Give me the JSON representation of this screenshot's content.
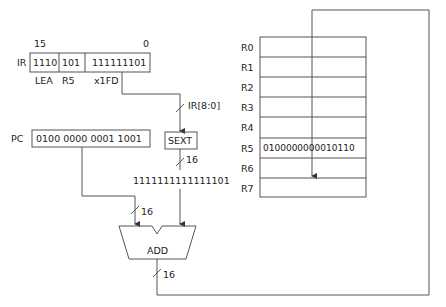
{
  "ir": {
    "label": "IR",
    "bit_high": "15",
    "bit_low": "0",
    "fields": [
      "1110",
      "101",
      "111111101"
    ],
    "field_labels": [
      "LEA",
      "R5",
      "x1FD"
    ]
  },
  "pc": {
    "label": "PC",
    "value": "0100 0000 0001 1001"
  },
  "sext": {
    "label": "SEXT",
    "input_label": "IR[8:0]",
    "output_width": "16",
    "output_value": "1111111111111101"
  },
  "adder": {
    "label": "ADD",
    "input_width": "16",
    "output_width": "16"
  },
  "regfile": {
    "registers": [
      {
        "name": "R0",
        "value": ""
      },
      {
        "name": "R1",
        "value": ""
      },
      {
        "name": "R2",
        "value": ""
      },
      {
        "name": "R3",
        "value": ""
      },
      {
        "name": "R4",
        "value": ""
      },
      {
        "name": "R5",
        "value": "0100000000010110"
      },
      {
        "name": "R6",
        "value": ""
      },
      {
        "name": "R7",
        "value": ""
      }
    ]
  }
}
